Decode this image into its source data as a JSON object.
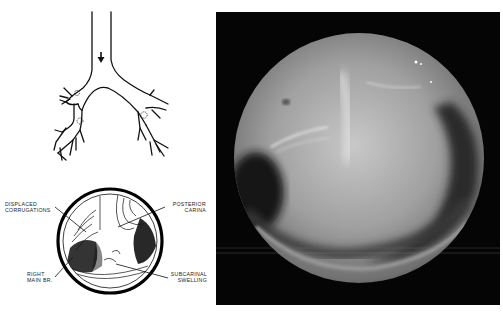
{
  "figure": {
    "schematic": {
      "title": "Bronchial tree schematic",
      "arrow": "viewing-direction-arrow"
    },
    "endoscopic_drawing": {
      "labels": [
        {
          "id": "displaced",
          "line1": "DISPLACED",
          "line2": "CORRUGATIONS"
        },
        {
          "id": "posterior",
          "line1": "POSTERIOR",
          "line2": "CARINA"
        },
        {
          "id": "right_main",
          "line1": "RIGHT",
          "line2": "MAIN BR."
        },
        {
          "id": "subcarinal",
          "line1": "SUBCARINAL",
          "line2": "SWELLING"
        }
      ]
    },
    "photo": {
      "description": "Bronchoscopic photograph of carina with subcarinal swelling",
      "background": "#050505"
    }
  }
}
